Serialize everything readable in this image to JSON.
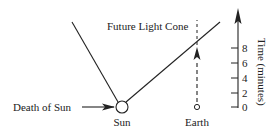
{
  "diagram": {
    "title_label": "Future Light Cone",
    "death_label": "Death of  Sun",
    "sun_label": "Sun",
    "earth_label": "Earth",
    "axis": {
      "label": "Time (minutes)",
      "ticks": [
        "0",
        "2",
        "4",
        "6",
        "8"
      ]
    },
    "colors": {
      "ink": "#222222",
      "background": "#ffffff"
    }
  }
}
